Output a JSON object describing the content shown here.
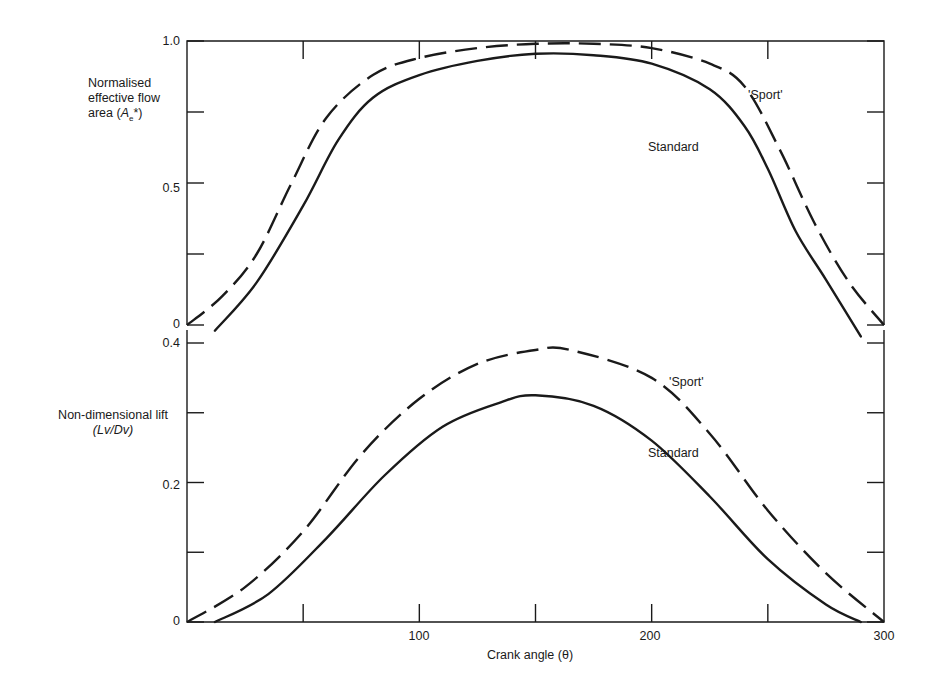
{
  "chart_data": [
    {
      "type": "line",
      "panel": "top",
      "title": "",
      "xlabel": "Crank angle (θ)",
      "ylabel": "Normalised effective flow area (Ae*)",
      "ylabel_lines": [
        "Normalised",
        "effective flow",
        "area (Ae*)"
      ],
      "xlim": [
        0,
        300
      ],
      "ylim": [
        0,
        1.0
      ],
      "ytick_labels": [
        "1.0",
        "0.5",
        "0"
      ],
      "ytick_values": [
        1.0,
        0.75,
        0.5,
        0.25,
        0
      ],
      "grid": false,
      "legend": "inline labels",
      "series": [
        {
          "name": "'Sport'",
          "style": "dashed",
          "x": [
            0,
            15,
            30,
            45,
            60,
            80,
            100,
            125,
            150,
            175,
            200,
            225,
            240,
            255,
            270,
            285,
            300
          ],
          "values": [
            0,
            0.1,
            0.25,
            0.5,
            0.73,
            0.88,
            0.94,
            0.975,
            0.99,
            0.99,
            0.975,
            0.92,
            0.84,
            0.62,
            0.36,
            0.15,
            0
          ]
        },
        {
          "name": "Standard",
          "style": "solid",
          "x": [
            12,
            30,
            50,
            65,
            80,
            100,
            125,
            150,
            175,
            200,
            225,
            240,
            250,
            262,
            275,
            290
          ],
          "values": [
            -0.02,
            0.15,
            0.42,
            0.65,
            0.8,
            0.88,
            0.93,
            0.955,
            0.95,
            0.92,
            0.83,
            0.7,
            0.55,
            0.33,
            0.16,
            -0.04
          ]
        }
      ],
      "annotations": [
        {
          "text": "'Sport'",
          "x": 257,
          "y": 0.86
        },
        {
          "text": "Standard",
          "x": 230,
          "y": 0.68
        }
      ]
    },
    {
      "type": "line",
      "panel": "bottom",
      "title": "",
      "xlabel": "Crank angle (θ)",
      "ylabel": "Non-dimensional lift (Lv/Dv)",
      "ylabel_lines": [
        "Non-dimensional lift",
        "(Lv/Dv)"
      ],
      "xlim": [
        0,
        300
      ],
      "ylim": [
        0,
        0.4
      ],
      "ytick_labels": [
        "0.4",
        "0.2",
        "0"
      ],
      "ytick_values": [
        0.4,
        0.3,
        0.2,
        0.1,
        0
      ],
      "xtick_labels": [
        "100",
        "200",
        "300"
      ],
      "xtick_values": [
        0,
        50,
        100,
        150,
        200,
        250,
        300
      ],
      "grid": false,
      "legend": "inline labels",
      "series": [
        {
          "name": "'Sport'",
          "style": "dashed",
          "x": [
            0,
            25,
            50,
            75,
            100,
            125,
            150,
            165,
            200,
            225,
            250,
            275,
            300
          ],
          "values": [
            0,
            0.05,
            0.13,
            0.24,
            0.32,
            0.37,
            0.39,
            0.39,
            0.35,
            0.27,
            0.16,
            0.07,
            0
          ]
        },
        {
          "name": "Standard",
          "style": "solid",
          "x": [
            12,
            35,
            60,
            85,
            110,
            135,
            150,
            175,
            200,
            225,
            250,
            275,
            290
          ],
          "values": [
            0,
            0.04,
            0.12,
            0.21,
            0.28,
            0.315,
            0.325,
            0.31,
            0.26,
            0.18,
            0.09,
            0.025,
            0
          ]
        }
      ],
      "annotations": [
        {
          "text": "'Sport'",
          "x": 215,
          "y": 0.335
        },
        {
          "text": "Standard",
          "x": 212,
          "y": 0.24
        }
      ]
    }
  ],
  "labels": {
    "top_ylabel_1": "Normalised",
    "top_ylabel_2": "effective flow",
    "top_ylabel_3_prefix": "area (",
    "top_ylabel_3_var": "A",
    "top_ylabel_3_sub": "e",
    "top_ylabel_3_suffix": "*)",
    "top_tick_1": "1.0",
    "top_tick_05": "0.5",
    "top_tick_0": "0",
    "bottom_ylabel_1": "Non-dimensional lift",
    "bottom_ylabel_2": "(Lv/Dv)",
    "bottom_tick_04": "0.4",
    "bottom_tick_02": "0.2",
    "bottom_tick_0": "0",
    "x_tick_100": "100",
    "x_tick_200": "200",
    "x_tick_300": "300",
    "xlabel": "Crank angle (θ)",
    "top_sport": "'Sport'",
    "top_standard": "Standard",
    "bottom_sport": "'Sport'",
    "bottom_standard": "Standard"
  },
  "colors": {
    "ink": "#1a1a1a",
    "background": "#ffffff"
  }
}
